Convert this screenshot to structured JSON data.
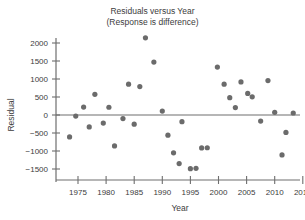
{
  "chart_data": {
    "type": "scatter",
    "title": "Residuals versus Year",
    "subtitle": "(Response is difference)",
    "xlabel": "Year",
    "ylabel": "Residual",
    "xlim": [
      1972,
      2016
    ],
    "ylim": [
      -1750,
      2300
    ],
    "xticks": [
      1975,
      1980,
      1985,
      1990,
      1995,
      2000,
      2005,
      2010,
      2015
    ],
    "xtick_labels": [
      "1975",
      "1980",
      "1985",
      "1990",
      "1995",
      "2000",
      "2005",
      "2010",
      "2015"
    ],
    "yticks": [
      -1500,
      -1000,
      -500,
      0,
      500,
      1000,
      1500,
      2000
    ],
    "ytick_labels": [
      "−1500",
      "−1000",
      "−500",
      "0",
      "500",
      "1000",
      "1500",
      "2000"
    ],
    "grid": false,
    "legend": false,
    "reference_line": 0,
    "marker_color": "#6b6b6b",
    "axis_color": "#6e6e6e",
    "points": [
      {
        "x": 1973.5,
        "y": -610
      },
      {
        "x": 1974.6,
        "y": -30
      },
      {
        "x": 1976.0,
        "y": 220
      },
      {
        "x": 1977.0,
        "y": -330
      },
      {
        "x": 1978.0,
        "y": 575
      },
      {
        "x": 1979.5,
        "y": -225
      },
      {
        "x": 1980.5,
        "y": 215
      },
      {
        "x": 1981.5,
        "y": -860
      },
      {
        "x": 1983.0,
        "y": -100
      },
      {
        "x": 1984.0,
        "y": 855
      },
      {
        "x": 1985.0,
        "y": -255
      },
      {
        "x": 1986.0,
        "y": 790
      },
      {
        "x": 1987.0,
        "y": 2145
      },
      {
        "x": 1988.5,
        "y": 1470
      },
      {
        "x": 1990.0,
        "y": 110
      },
      {
        "x": 1991.0,
        "y": -560
      },
      {
        "x": 1992.0,
        "y": -1050
      },
      {
        "x": 1993.0,
        "y": -1350
      },
      {
        "x": 1993.5,
        "y": -185
      },
      {
        "x": 1995.0,
        "y": -1490
      },
      {
        "x": 1996.0,
        "y": -1480
      },
      {
        "x": 1997.0,
        "y": -915
      },
      {
        "x": 1998.0,
        "y": -910
      },
      {
        "x": 1999.8,
        "y": 1330
      },
      {
        "x": 2001.0,
        "y": 855
      },
      {
        "x": 2002.0,
        "y": 480
      },
      {
        "x": 2003.0,
        "y": 205
      },
      {
        "x": 2004.0,
        "y": 920
      },
      {
        "x": 2005.2,
        "y": 600
      },
      {
        "x": 2006.0,
        "y": 505
      },
      {
        "x": 2007.5,
        "y": -170
      },
      {
        "x": 2008.8,
        "y": 955
      },
      {
        "x": 2010.0,
        "y": 75
      },
      {
        "x": 2011.3,
        "y": -1110
      },
      {
        "x": 2012.0,
        "y": -485
      },
      {
        "x": 2013.3,
        "y": 55
      }
    ]
  }
}
